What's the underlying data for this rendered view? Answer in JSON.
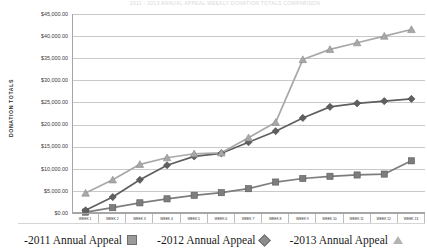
{
  "chart_data": {
    "type": "line",
    "title": "2011 - 2013 ANNUAL APPEAL WEEKLY DONATION TOTALS COMPARISON",
    "xlabel": "",
    "ylabel": "DONATION TOTALS",
    "ylim": [
      0,
      45000
    ],
    "ytick_step": 5000,
    "grid": true,
    "legend_position": "bottom",
    "categories": [
      "WEEK 1",
      "WEEK 2",
      "WEEK 3",
      "WEEK 4",
      "WEEK 5",
      "WEEK 6",
      "WEEK 7",
      "WEEK 8",
      "WEEK 9",
      "WEEK 10",
      "WEEK 11",
      "WEEK 12",
      "WEEK 13"
    ],
    "ytick_labels": [
      "$45,000.00",
      "$40,000.00",
      "$35,000.00",
      "$30,000.00",
      "$25,000.00",
      "$20,000.00",
      "$15,000.00",
      "$10,000.00",
      "$5,000.00",
      "$0.00"
    ],
    "series": [
      {
        "name": "-2011 Annual Appeal",
        "marker": "square",
        "color": "#7d7d7d",
        "values": [
          200,
          1200,
          2300,
          3200,
          4000,
          4600,
          5500,
          7000,
          7800,
          8300,
          8600,
          8800,
          11800
        ]
      },
      {
        "name": "-2012 Annual Appeal",
        "marker": "diamond",
        "color": "#5f5f5f",
        "values": [
          600,
          3600,
          7500,
          10800,
          12800,
          13500,
          16000,
          18500,
          21500,
          24000,
          24800,
          25300,
          25800
        ]
      },
      {
        "name": "-2013 Annual Appeal",
        "marker": "triangle",
        "color": "#a8a8a8",
        "values": [
          4500,
          7500,
          11000,
          12500,
          13400,
          13600,
          17000,
          20500,
          34700,
          37000,
          38500,
          40000,
          41500
        ]
      }
    ]
  },
  "legend": {
    "items": [
      {
        "label": "-2011 Annual Appeal",
        "marker": "square-marker"
      },
      {
        "label": "-2012 Annual Appeal",
        "marker": "diamond-marker"
      },
      {
        "label": "-2013 Annual Appeal",
        "marker": "triangle-marker"
      }
    ]
  }
}
